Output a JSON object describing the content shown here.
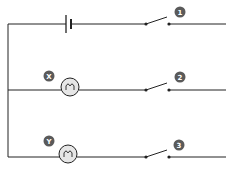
{
  "diagram": {
    "type": "circuit",
    "colors": {
      "wire": "#222222",
      "badge": "#5a5a5a",
      "bulb_fill": "#e6e6e6",
      "badge_text": "#ffffff"
    },
    "battery": {
      "label": ""
    },
    "bulbs": [
      {
        "id": "X",
        "label": "X"
      },
      {
        "id": "Y",
        "label": "Y"
      }
    ],
    "switches": [
      {
        "id": "1",
        "label": "1",
        "state": "open"
      },
      {
        "id": "2",
        "label": "2",
        "state": "open"
      },
      {
        "id": "3",
        "label": "3",
        "state": "open"
      }
    ]
  }
}
